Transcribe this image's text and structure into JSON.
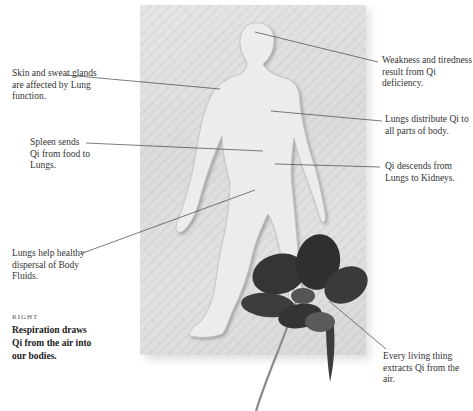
{
  "labels": {
    "skin": "Skin and sweat glands are affected by Lung function.",
    "spleen": "Spleen sends Qi from food to Lungs.",
    "fluids": "Lungs help healthy dispersal of Body Fluids.",
    "weakness": "Weakness and tiredness result from Qi deficiency.",
    "distribute": "Lungs distribute Qi to all parts of body.",
    "descends": "Qi descends from Lungs to Kidneys.",
    "every": "Every living thing extracts Qi from the air."
  },
  "caption": {
    "kicker": "RIGHT",
    "text": "Respiration draws Qi from the air into our bodies."
  },
  "colors": {
    "stone": "#dedede",
    "flower": "#3a3a3a",
    "leader_line": "#444444"
  }
}
